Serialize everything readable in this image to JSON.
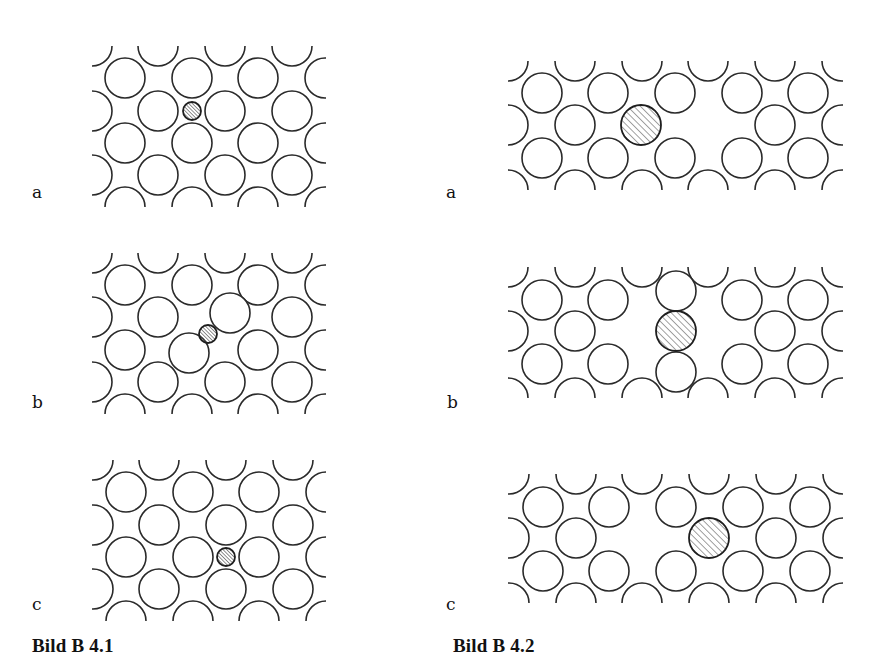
{
  "figures": [
    {
      "caption": "Bild B 4.1",
      "caption_pos": {
        "x": 32,
        "y": 636
      },
      "description": "Interstitial (small foreign atom) in close-packed lattice",
      "panels": [
        {
          "label": "a",
          "label_pos": {
            "x": 32,
            "y": 184
          },
          "clip": {
            "x": 92,
            "y": 46,
            "w": 234,
            "h": 161
          },
          "lattice": {
            "r": 20,
            "rows_y": [
              46,
              78,
              111,
              143,
              175,
              207
            ],
            "odd_x": [
              125,
              192,
              258,
              325
            ],
            "even_x": [
              92,
              158,
              225,
              292
            ],
            "first_row_parity": "even"
          },
          "omit": [],
          "extra_atoms": [],
          "defects": [
            {
              "cx": 192,
              "cy": 111,
              "r": 9,
              "type": "small-interstitial"
            }
          ]
        },
        {
          "label": "b",
          "label_pos": {
            "x": 32,
            "y": 394
          },
          "clip": {
            "x": 92,
            "y": 253,
            "w": 234,
            "h": 161
          },
          "lattice": {
            "r": 20,
            "rows_y": [
              253,
              285,
              317,
              350,
              382,
              414
            ],
            "odd_x": [
              125,
              192,
              258,
              325
            ],
            "even_x": [
              92,
              158,
              225,
              292
            ],
            "first_row_parity": "even"
          },
          "omit": [
            {
              "cx": 225,
              "cy": 317
            },
            {
              "cx": 192,
              "cy": 350
            }
          ],
          "extra_atoms": [
            {
              "cx": 230,
              "cy": 313,
              "r": 20
            },
            {
              "cx": 189,
              "cy": 353,
              "r": 20
            }
          ],
          "defects": [
            {
              "cx": 208,
              "cy": 334,
              "r": 9,
              "type": "small-interstitial-saddle"
            }
          ]
        },
        {
          "label": "c",
          "label_pos": {
            "x": 32,
            "y": 596
          },
          "clip": {
            "x": 92,
            "y": 460,
            "w": 234,
            "h": 161
          },
          "lattice": {
            "r": 20,
            "rows_y": [
              460,
              492,
              525,
              557,
              589,
              621
            ],
            "odd_x": [
              126,
              193,
              259,
              326
            ],
            "even_x": [
              93,
              159,
              226,
              293
            ],
            "first_row_parity": "even"
          },
          "omit": [],
          "extra_atoms": [],
          "defects": [
            {
              "cx": 226,
              "cy": 557,
              "r": 9,
              "type": "small-interstitial"
            }
          ]
        }
      ]
    },
    {
      "caption": "Bild B 4.2",
      "caption_pos": {
        "x": 453,
        "y": 636
      },
      "description": "Large substitutional / vacancy defect in close-packed lattice",
      "panels": [
        {
          "label": "a",
          "label_pos": {
            "x": 446,
            "y": 184
          },
          "clip": {
            "x": 508,
            "y": 61,
            "w": 335,
            "h": 129
          },
          "lattice": {
            "r": 20,
            "rows_y": [
              61,
              93,
              125,
              158,
              190
            ],
            "odd_x": [
              542,
              608,
              675,
              742,
              808
            ],
            "even_x": [
              508,
              575,
              642,
              708,
              775,
              842
            ],
            "first_row_parity": "even"
          },
          "omit": [
            {
              "cx": 642,
              "cy": 125
            },
            {
              "cx": 708,
              "cy": 125
            }
          ],
          "extra_atoms": [],
          "defects": [
            {
              "cx": 641,
              "cy": 125,
              "r": 20,
              "type": "large-substitutional"
            }
          ]
        },
        {
          "label": "b",
          "label_pos": {
            "x": 447,
            "y": 394
          },
          "clip": {
            "x": 508,
            "y": 267,
            "w": 335,
            "h": 131
          },
          "lattice": {
            "r": 20,
            "rows_y": [
              267,
              300,
              331,
              364,
              398
            ],
            "odd_x": [
              542,
              608,
              675,
              742,
              808
            ],
            "even_x": [
              508,
              575,
              642,
              708,
              775,
              842
            ],
            "first_row_parity": "even"
          },
          "omit": [
            {
              "cx": 675,
              "cy": 300
            },
            {
              "cx": 642,
              "cy": 331
            },
            {
              "cx": 708,
              "cy": 331
            },
            {
              "cx": 675,
              "cy": 364
            }
          ],
          "extra_atoms": [
            {
              "cx": 676,
              "cy": 291,
              "r": 20
            },
            {
              "cx": 676,
              "cy": 372,
              "r": 20
            }
          ],
          "defects": [
            {
              "cx": 676,
              "cy": 331,
              "r": 20,
              "type": "large-split"
            }
          ]
        },
        {
          "label": "c",
          "label_pos": {
            "x": 446,
            "y": 596
          },
          "clip": {
            "x": 508,
            "y": 474,
            "w": 335,
            "h": 129
          },
          "lattice": {
            "r": 20,
            "rows_y": [
              474,
              507,
              538,
              571,
              603
            ],
            "odd_x": [
              543,
              609,
              676,
              743,
              810
            ],
            "even_x": [
              509,
              576,
              642,
              709,
              776,
              843
            ],
            "first_row_parity": "even"
          },
          "omit": [
            {
              "cx": 642,
              "cy": 538
            },
            {
              "cx": 709,
              "cy": 538
            }
          ],
          "extra_atoms": [],
          "defects": [
            {
              "cx": 709,
              "cy": 538,
              "r": 20,
              "type": "large-substitutional"
            }
          ]
        }
      ]
    }
  ],
  "colors": {
    "stroke": "#2a2a2a",
    "hatch": "#444444",
    "background": "#ffffff",
    "text": "#111111"
  }
}
